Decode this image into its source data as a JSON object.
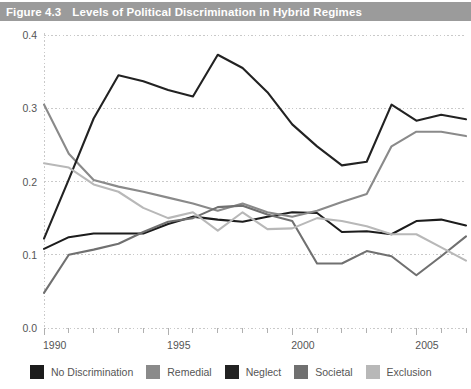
{
  "title": {
    "figure_number": "Figure 4.3",
    "text": "Levels of Political Discrimination in Hybrid Regimes",
    "bar_color": "#9b9b9b",
    "text_color": "#ffffff"
  },
  "chart_data": {
    "type": "line",
    "title": "Levels of Political Discrimination in Hybrid Regimes",
    "xlabel": "",
    "ylabel": "",
    "grid": true,
    "legend_position": "bottom",
    "xlim": [
      1990,
      2007
    ],
    "ylim": [
      0.0,
      0.4
    ],
    "ytick_labels": [
      "0.0",
      "0.1",
      "0.2",
      "0.3",
      "0.4"
    ],
    "yticks": [
      0.0,
      0.1,
      0.2,
      0.3,
      0.4
    ],
    "xtick_labels": [
      "1990",
      "1995",
      "2000",
      "2005"
    ],
    "xticks": [
      1990,
      1995,
      2000,
      2005
    ],
    "x": [
      1990,
      1991,
      1992,
      1993,
      1994,
      1995,
      1996,
      1997,
      1998,
      1999,
      2000,
      2001,
      2002,
      2003,
      2004,
      2005,
      2006,
      2007
    ],
    "series": [
      {
        "name": "No Discrimination",
        "color": "#1c1c1c",
        "values": [
          0.108,
          0.124,
          0.129,
          0.129,
          0.129,
          0.142,
          0.152,
          0.148,
          0.145,
          0.152,
          0.158,
          0.157,
          0.131,
          0.132,
          0.128,
          0.146,
          0.148,
          0.14
        ]
      },
      {
        "name": "Remedial",
        "color": "#8a8a8a",
        "values": [
          0.305,
          0.238,
          0.202,
          0.193,
          0.186,
          0.178,
          0.17,
          0.16,
          0.17,
          0.158,
          0.152,
          0.16,
          0.172,
          0.183,
          0.248,
          0.268,
          0.268,
          0.262
        ]
      },
      {
        "name": "Neglect",
        "color": "#222222",
        "values": [
          0.122,
          0.203,
          0.286,
          0.345,
          0.337,
          0.325,
          0.316,
          0.373,
          0.355,
          0.322,
          0.278,
          0.248,
          0.222,
          0.227,
          0.305,
          0.283,
          0.291,
          0.285
        ]
      },
      {
        "name": "Societal",
        "color": "#707070",
        "values": [
          0.048,
          0.1,
          0.107,
          0.115,
          0.131,
          0.145,
          0.15,
          0.165,
          0.167,
          0.155,
          0.146,
          0.088,
          0.088,
          0.105,
          0.098,
          0.072,
          0.098,
          0.125
        ]
      },
      {
        "name": "Exclusion",
        "color": "#b8b8b8",
        "values": [
          0.225,
          0.219,
          0.196,
          0.186,
          0.164,
          0.15,
          0.158,
          0.133,
          0.158,
          0.135,
          0.136,
          0.15,
          0.146,
          0.139,
          0.128,
          0.128,
          0.11,
          0.092
        ]
      }
    ]
  },
  "legend": {
    "items": [
      {
        "label": "No Discrimination",
        "color": "#1c1c1c"
      },
      {
        "label": "Remedial",
        "color": "#8a8a8a"
      },
      {
        "label": "Neglect",
        "color": "#222222"
      },
      {
        "label": "Societal",
        "color": "#707070"
      },
      {
        "label": "Exclusion",
        "color": "#b8b8b8"
      }
    ]
  }
}
